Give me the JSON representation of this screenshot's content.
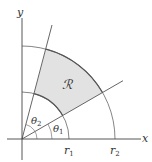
{
  "diagram": {
    "type": "polar-region",
    "axes": {
      "x_label": "x",
      "y_label": "y"
    },
    "region_label": "ℛ",
    "radii": [
      {
        "name": "r1",
        "label": "r",
        "sub": "1"
      },
      {
        "name": "r2",
        "label": "r",
        "sub": "2"
      }
    ],
    "angles": [
      {
        "name": "theta1",
        "label": "θ",
        "sub": "1",
        "degrees": 30
      },
      {
        "name": "theta2",
        "label": "θ",
        "sub": "2",
        "degrees": 75
      }
    ],
    "colors": {
      "region_fill": "#e2e2e2",
      "line": "#555555",
      "axis": "#444444"
    }
  }
}
